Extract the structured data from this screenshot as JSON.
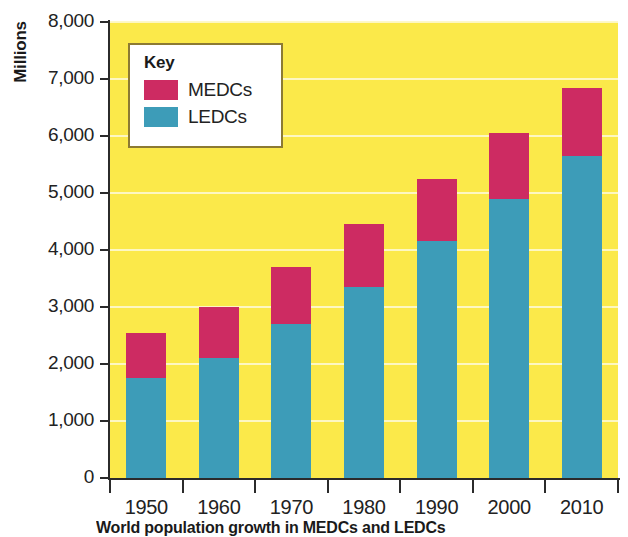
{
  "chart_data": {
    "type": "bar",
    "title": "",
    "subtitle": "",
    "stacked": true,
    "xlabel": "",
    "ylabel": "Millions",
    "categories": [
      "1950",
      "1960",
      "1970",
      "1980",
      "1990",
      "2000",
      "2010"
    ],
    "series": [
      {
        "name": "LEDCs",
        "color": "#3d9cb8",
        "values": [
          1750,
          2100,
          2700,
          3350,
          4150,
          4900,
          5650
        ]
      },
      {
        "name": "MEDCs",
        "color": "#cd2b62",
        "values": [
          800,
          900,
          1000,
          1100,
          1100,
          1150,
          1200
        ]
      }
    ],
    "totals": [
      2550,
      3000,
      3700,
      4450,
      5250,
      6050,
      6850
    ],
    "ylim": [
      0,
      8000
    ],
    "ytick_values": [
      0,
      1000,
      2000,
      3000,
      4000,
      5000,
      6000,
      7000,
      8000
    ],
    "ytick_labels": [
      "0",
      "1,000",
      "2,000",
      "3,000",
      "4,000",
      "5,000",
      "6,000",
      "7,000",
      "8,000"
    ],
    "grid": true,
    "grid_axis": "y",
    "legend_position": "upper-left-inside",
    "plot_background": "#fbe94a",
    "gridline_color": "#fdf8c8"
  },
  "axes": {
    "y_title": "Millions",
    "y_labels": [
      "8,000",
      "7,000",
      "6,000",
      "5,000",
      "4,000",
      "3,000",
      "2,000",
      "1,000",
      "0"
    ],
    "x_labels": [
      "1950",
      "1960",
      "1970",
      "1980",
      "1990",
      "2000",
      "2010"
    ]
  },
  "legend": {
    "title": "Key",
    "items": [
      {
        "label": "MEDCs",
        "color": "#cd2b62"
      },
      {
        "label": "LEDCs",
        "color": "#3d9cb8"
      }
    ]
  },
  "caption": {
    "text": "World population growth in MEDCs and LEDCs"
  }
}
